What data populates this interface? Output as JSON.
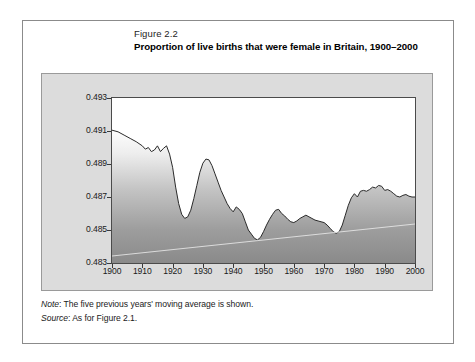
{
  "figure": {
    "number": "Figure 2.2",
    "title": "Proportion of live births that were female in Britain, 1900–2000"
  },
  "footnotes": {
    "note_key": "Note",
    "note_text": ": The five previous years' moving average is shown.",
    "source_key": "Source",
    "source_text": ": As for Figure 2.1."
  },
  "colors": {
    "panel_background": "#dcdcdc",
    "card_border": "#8b8b8b",
    "axis": "#3a3a3a",
    "line": "#2a2a2a",
    "fill_top": "#fdfdfd",
    "fill_bottom": "#8a8a8a"
  },
  "chart_data": {
    "type": "area",
    "title": "Proportion of live births that were female in Britain, 1900–2000",
    "xlabel": "",
    "ylabel": "",
    "xlim": [
      1900,
      2000
    ],
    "ylim": [
      0.483,
      0.493
    ],
    "grid": false,
    "legend": null,
    "ytick_labels": [
      "0.493",
      "0.491",
      "0.489",
      "0.487",
      "0.485",
      "0.483"
    ],
    "ytick_values": [
      0.493,
      0.491,
      0.489,
      0.487,
      0.485,
      0.483
    ],
    "xtick_labels": [
      "1900",
      "1910",
      "1920",
      "1930",
      "1940",
      "1950",
      "1960",
      "1970",
      "1980",
      "1990",
      "2000"
    ],
    "xtick_values": [
      1900,
      1910,
      1920,
      1930,
      1940,
      1950,
      1960,
      1970,
      1980,
      1990,
      2000
    ],
    "series": [
      {
        "name": "Proportion female (5-year moving average)",
        "x": [
          1900,
          1902,
          1904,
          1906,
          1908,
          1910,
          1911,
          1912,
          1913,
          1914,
          1915,
          1916,
          1917,
          1918,
          1919,
          1920,
          1921,
          1922,
          1923,
          1924,
          1925,
          1926,
          1927,
          1928,
          1929,
          1930,
          1931,
          1932,
          1933,
          1934,
          1935,
          1936,
          1937,
          1938,
          1939,
          1940,
          1941,
          1942,
          1943,
          1944,
          1945,
          1946,
          1947,
          1948,
          1949,
          1950,
          1951,
          1952,
          1953,
          1954,
          1955,
          1956,
          1957,
          1958,
          1959,
          1960,
          1961,
          1962,
          1963,
          1964,
          1965,
          1966,
          1967,
          1968,
          1969,
          1970,
          1971,
          1972,
          1973,
          1974,
          1975,
          1976,
          1977,
          1978,
          1979,
          1980,
          1981,
          1982,
          1983,
          1984,
          1985,
          1986,
          1987,
          1988,
          1989,
          1990,
          1991,
          1992,
          1993,
          1994,
          1995,
          1996,
          1997,
          1998,
          1999,
          2000
        ],
        "y": [
          0.49105,
          0.49095,
          0.49075,
          0.49055,
          0.49035,
          0.4901,
          0.4899,
          0.49,
          0.48975,
          0.48985,
          0.4901,
          0.48975,
          0.48995,
          0.4901,
          0.4896,
          0.4888,
          0.4876,
          0.4866,
          0.48595,
          0.4857,
          0.4858,
          0.4862,
          0.4869,
          0.4877,
          0.4885,
          0.48905,
          0.4893,
          0.48925,
          0.4889,
          0.4884,
          0.4879,
          0.4874,
          0.487,
          0.4866,
          0.4863,
          0.4861,
          0.4864,
          0.48625,
          0.486,
          0.4855,
          0.485,
          0.48475,
          0.4845,
          0.4844,
          0.48455,
          0.4849,
          0.4853,
          0.48565,
          0.48595,
          0.4862,
          0.48625,
          0.486,
          0.48585,
          0.48565,
          0.4855,
          0.48545,
          0.48555,
          0.4857,
          0.4858,
          0.4859,
          0.4858,
          0.4857,
          0.4856,
          0.48555,
          0.4855,
          0.48545,
          0.4853,
          0.4851,
          0.4849,
          0.4848,
          0.4849,
          0.4853,
          0.4859,
          0.4865,
          0.48695,
          0.4872,
          0.487,
          0.48735,
          0.4874,
          0.48735,
          0.48745,
          0.4876,
          0.48755,
          0.4877,
          0.48765,
          0.4874,
          0.48745,
          0.48735,
          0.4872,
          0.48705,
          0.487,
          0.4871,
          0.48715,
          0.48705,
          0.487,
          0.487
        ]
      }
    ]
  }
}
